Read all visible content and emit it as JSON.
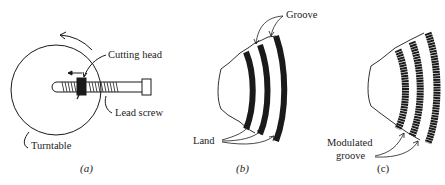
{
  "figure": {
    "panel_a": {
      "caption": "(a)",
      "labels": {
        "cutting_head": "Cutting head",
        "lead_screw": "Lead screw",
        "turntable": "Turntable"
      }
    },
    "panel_b": {
      "caption": "(b)",
      "labels": {
        "groove": "Groove",
        "land": "Land"
      }
    },
    "panel_c": {
      "caption": "(c)",
      "labels": {
        "modulated_line1": "Modulated",
        "modulated_line2": "groove"
      }
    },
    "colors": {
      "ink": "#1a1a1a",
      "background": "#ffffff"
    }
  }
}
